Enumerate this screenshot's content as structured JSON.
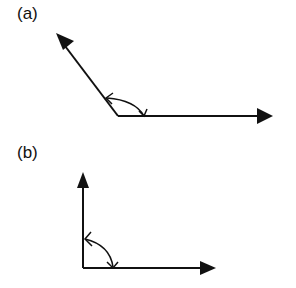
{
  "panels": [
    {
      "label": "(a)",
      "description": "obtuse angle between two vectors with double-headed angle arc"
    },
    {
      "label": "(b)",
      "description": "right angle between two vectors with double-headed angle arc"
    }
  ],
  "colors": {
    "stroke": "#111111",
    "background": "#ffffff"
  }
}
